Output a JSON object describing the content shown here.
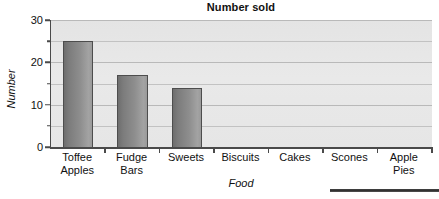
{
  "chart_data": {
    "type": "bar",
    "title": "Number sold",
    "xlabel": "Food",
    "ylabel": "Number",
    "categories": [
      "Toffee Apples",
      "Fudge Bars",
      "Sweets",
      "Biscuits",
      "Cakes",
      "Scones",
      "Apple Pies"
    ],
    "category_lines": [
      [
        "Toffee",
        "Apples"
      ],
      [
        "Fudge",
        "Bars"
      ],
      [
        "Sweets",
        ""
      ],
      [
        "Biscuits",
        ""
      ],
      [
        "Cakes",
        ""
      ],
      [
        "Scones",
        ""
      ],
      [
        "Apple",
        "Pies"
      ]
    ],
    "values": [
      25,
      17,
      14,
      0,
      0,
      0,
      0
    ],
    "ylim": [
      0,
      30
    ],
    "ytick_labels": [
      "30",
      "20",
      "10",
      "0"
    ],
    "ytick_values": [
      30,
      20,
      10,
      0
    ],
    "yminor_values": [
      25,
      15,
      5
    ],
    "gridline_values": [
      30,
      25,
      20,
      15,
      10,
      5
    ],
    "grid": true,
    "legend": false,
    "colors": {
      "bar_dark": "#6e6e6e",
      "bar_light": "#a3a3a3",
      "bar_border": "#4d4d4d",
      "plot_background": "#e7e7e7",
      "gridline": "#c2c2c2",
      "axis": "#4a4a4a",
      "text": "#111111"
    }
  }
}
